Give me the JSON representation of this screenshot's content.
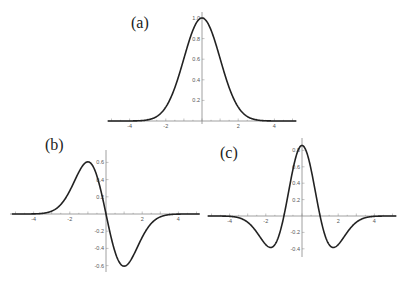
{
  "chart_data": [
    {
      "type": "line",
      "panel_label": "(a)",
      "title": "",
      "xlabel": "",
      "ylabel": "",
      "x_ticks": [
        "-4",
        "-2",
        "2",
        "4"
      ],
      "y_ticks": [
        "0.2",
        "0.4",
        "0.6",
        "0.8",
        "1.0"
      ],
      "xlim": [
        -5,
        5
      ],
      "ylim": [
        0,
        1.0
      ],
      "function": "exp(-x^2/2)",
      "x": [
        -5,
        -4,
        -3,
        -2,
        -1.5,
        -1,
        -0.5,
        0,
        0.5,
        1,
        1.5,
        2,
        3,
        4,
        5
      ],
      "y": [
        0,
        0.0003,
        0.011,
        0.135,
        0.325,
        0.607,
        0.882,
        1.0,
        0.882,
        0.607,
        0.325,
        0.135,
        0.011,
        0.0003,
        0
      ],
      "grid": false
    },
    {
      "type": "line",
      "panel_label": "(b)",
      "x_ticks": [
        "-4",
        "-2",
        "2",
        "4"
      ],
      "y_ticks": [
        "-0.6",
        "-0.4",
        "-0.2",
        "0.2",
        "0.4",
        "0.6"
      ],
      "xlim": [
        -5,
        5
      ],
      "ylim": [
        -0.65,
        0.65
      ],
      "function": "-x*exp(-x^2/2)",
      "x": [
        -5,
        -4,
        -3,
        -2,
        -1.5,
        -1,
        -0.5,
        0,
        0.5,
        1,
        1.5,
        2,
        3,
        4,
        5
      ],
      "y": [
        0,
        0.001,
        0.033,
        0.271,
        0.487,
        0.607,
        0.441,
        0,
        -0.441,
        -0.607,
        -0.487,
        -0.271,
        -0.033,
        -0.001,
        0
      ],
      "grid": false
    },
    {
      "type": "line",
      "panel_label": "(c)",
      "x_ticks": [
        "-4",
        "-2",
        "2",
        "4"
      ],
      "y_ticks": [
        "-0.4",
        "-0.2",
        "0.2",
        "0.4",
        "0.6",
        "0.8"
      ],
      "xlim": [
        -5,
        5
      ],
      "ylim": [
        -0.45,
        0.9
      ],
      "function": "(1-x^2)*exp(-x^2/2)",
      "x": [
        -5,
        -4,
        -3,
        -2,
        -1.73,
        -1.5,
        -1,
        -0.5,
        0,
        0.5,
        1,
        1.5,
        1.73,
        2,
        3,
        4,
        5
      ],
      "y": [
        0,
        -0.005,
        -0.089,
        -0.406,
        -0.446,
        -0.406,
        0,
        0.662,
        1.0,
        0.662,
        0,
        -0.406,
        -0.446,
        -0.406,
        -0.089,
        -0.005,
        0
      ],
      "display_peak": 0.86,
      "grid": false
    }
  ]
}
